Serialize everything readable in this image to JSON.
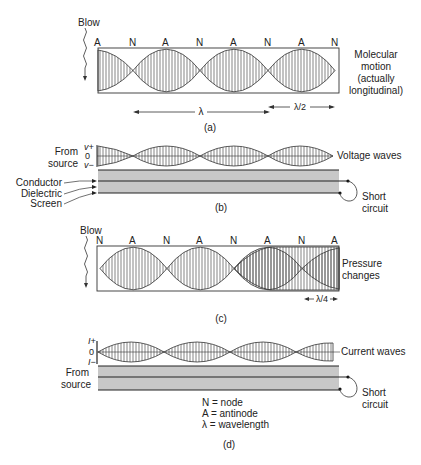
{
  "panels": {
    "a": {
      "caption": "(a)",
      "blow_label": "Blow",
      "node_labels": [
        "A",
        "N",
        "A",
        "N",
        "A",
        "N",
        "A",
        "N"
      ],
      "side_label": [
        "Molecular",
        "motion",
        "(actually",
        "longitudinal)"
      ],
      "lambda_label": "λ",
      "half_lambda_label": "λ/2"
    },
    "b": {
      "caption": "(b)",
      "source_label": [
        "From",
        "source"
      ],
      "axis_labels": [
        "v+",
        "0",
        "v−"
      ],
      "wave_label": "Voltage waves",
      "cable_layers": [
        "Conductor",
        "Dielectric",
        "Screen"
      ],
      "end_label": [
        "Short",
        "circuit"
      ]
    },
    "c": {
      "caption": "(c)",
      "blow_label": "Blow",
      "node_labels": [
        "N",
        "A",
        "N",
        "A",
        "N",
        "A",
        "N",
        "A"
      ],
      "side_label": [
        "Pressure",
        "changes"
      ],
      "quarter_lambda_label": "λ/4"
    },
    "d": {
      "caption": "(d)",
      "source_label": [
        "From",
        "source"
      ],
      "axis_labels": [
        "I+",
        "0",
        "I−"
      ],
      "wave_label": "Current waves",
      "end_label": [
        "Short",
        "circuit"
      ]
    }
  },
  "legend": [
    "N = node",
    "A = antinode",
    "λ = wavelength"
  ],
  "colors": {
    "line": "#222222",
    "cable_fill": "#c8c8c8",
    "background": "#ffffff"
  }
}
